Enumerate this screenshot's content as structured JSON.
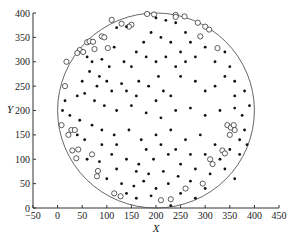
{
  "chart_data": {
    "type": "scatter",
    "title": "",
    "xlabel": "X",
    "ylabel": "Y",
    "xlim": [
      -50,
      450
    ],
    "ylim": [
      0,
      400
    ],
    "xticks": [
      -50,
      0,
      50,
      100,
      150,
      200,
      250,
      300,
      350,
      400,
      450
    ],
    "yticks": [
      0,
      50,
      100,
      150,
      200,
      250,
      300,
      350,
      400
    ],
    "grid": false,
    "legend": null,
    "boundary_circle": {
      "cx": 200,
      "cy": 200,
      "r": 200
    },
    "series": [
      {
        "name": "boundary nodes",
        "marker": "open-circle",
        "points": [
          [
            182,
            398
          ],
          [
            196,
            397
          ],
          [
            240,
            396
          ],
          [
            258,
            393
          ],
          [
            110,
            386
          ],
          [
            130,
            378
          ],
          [
            150,
            376
          ],
          [
            145,
            372
          ],
          [
            60,
            340
          ],
          [
            65,
            342
          ],
          [
            72,
            341
          ],
          [
            90,
            352
          ],
          [
            95,
            350
          ],
          [
            45,
            324
          ],
          [
            40,
            318
          ],
          [
            52,
            320
          ],
          [
            18,
            300
          ],
          [
            102,
            328
          ],
          [
            75,
            326
          ],
          [
            240,
            392
          ],
          [
            285,
            380
          ],
          [
            300,
            372
          ],
          [
            308,
            366
          ],
          [
            290,
            352
          ],
          [
            325,
            328
          ],
          [
            15,
            250
          ],
          [
            8,
            170
          ],
          [
            22,
            150
          ],
          [
            30,
            118
          ],
          [
            38,
            102
          ],
          [
            28,
            160
          ],
          [
            35,
            160
          ],
          [
            42,
            120
          ],
          [
            70,
            110
          ],
          [
            82,
            76
          ],
          [
            80,
            65
          ],
          [
            115,
            30
          ],
          [
            128,
            24
          ],
          [
            345,
            170
          ],
          [
            352,
            165
          ],
          [
            358,
            170
          ],
          [
            360,
            160
          ],
          [
            350,
            150
          ],
          [
            335,
            118
          ],
          [
            340,
            112
          ],
          [
            310,
            100
          ],
          [
            315,
            90
          ],
          [
            295,
            50
          ],
          [
            260,
            40
          ],
          [
            210,
            16
          ],
          [
            230,
            18
          ]
        ]
      },
      {
        "name": "interior nodes",
        "marker": "filled-dot",
        "points": [
          [
            120,
            370
          ],
          [
            140,
            372
          ],
          [
            200,
            390
          ],
          [
            220,
            385
          ],
          [
            190,
            360
          ],
          [
            210,
            350
          ],
          [
            175,
            340
          ],
          [
            230,
            340
          ],
          [
            90,
            305
          ],
          [
            105,
            290
          ],
          [
            135,
            300
          ],
          [
            150,
            290
          ],
          [
            60,
            310
          ],
          [
            70,
            300
          ],
          [
            85,
            270
          ],
          [
            100,
            260
          ],
          [
            130,
            255
          ],
          [
            165,
            260
          ],
          [
            185,
            250
          ],
          [
            205,
            270
          ],
          [
            250,
            270
          ],
          [
            280,
            260
          ],
          [
            300,
            240
          ],
          [
            320,
            250
          ],
          [
            340,
            270
          ],
          [
            360,
            230
          ],
          [
            40,
            230
          ],
          [
            55,
            235
          ],
          [
            75,
            220
          ],
          [
            95,
            210
          ],
          [
            120,
            200
          ],
          [
            150,
            210
          ],
          [
            180,
            195
          ],
          [
            210,
            185
          ],
          [
            240,
            200
          ],
          [
            270,
            205
          ],
          [
            300,
            190
          ],
          [
            330,
            200
          ],
          [
            360,
            205
          ],
          [
            375,
            190
          ],
          [
            25,
            190
          ],
          [
            45,
            180
          ],
          [
            70,
            170
          ],
          [
            90,
            160
          ],
          [
            115,
            150
          ],
          [
            145,
            160
          ],
          [
            170,
            140
          ],
          [
            200,
            150
          ],
          [
            230,
            160
          ],
          [
            260,
            140
          ],
          [
            290,
            150
          ],
          [
            320,
            130
          ],
          [
            350,
            120
          ],
          [
            370,
            110
          ],
          [
            60,
            100
          ],
          [
            85,
            95
          ],
          [
            110,
            110
          ],
          [
            140,
            100
          ],
          [
            165,
            90
          ],
          [
            195,
            100
          ],
          [
            225,
            110
          ],
          [
            250,
            90
          ],
          [
            280,
            80
          ],
          [
            310,
            70
          ],
          [
            340,
            80
          ],
          [
            360,
            60
          ],
          [
            100,
            60
          ],
          [
            130,
            50
          ],
          [
            155,
            45
          ],
          [
            175,
            55
          ],
          [
            200,
            40
          ],
          [
            225,
            50
          ],
          [
            250,
            30
          ],
          [
            280,
            20
          ],
          [
            300,
            40
          ],
          [
            160,
            20
          ],
          [
            190,
            25
          ],
          [
            140,
            30
          ],
          [
            230,
            5
          ],
          [
            240,
            380
          ],
          [
            260,
            360
          ],
          [
            270,
            340
          ],
          [
            250,
            320
          ],
          [
            280,
            310
          ],
          [
            300,
            330
          ],
          [
            320,
            300
          ],
          [
            340,
            320
          ],
          [
            350,
            290
          ],
          [
            360,
            260
          ],
          [
            380,
            240
          ],
          [
            380,
            160
          ],
          [
            370,
            140
          ],
          [
            385,
            130
          ],
          [
            390,
            210
          ],
          [
            10,
            200
          ],
          [
            15,
            220
          ],
          [
            50,
            260
          ],
          [
            65,
            280
          ],
          [
            115,
            330
          ],
          [
            160,
            320
          ],
          [
            180,
            310
          ],
          [
            200,
            300
          ],
          [
            220,
            310
          ],
          [
            240,
            290
          ],
          [
            260,
            300
          ],
          [
            200,
            220
          ],
          [
            215,
            240
          ],
          [
            230,
            230
          ],
          [
            160,
            230
          ],
          [
            140,
            240
          ],
          [
            110,
            240
          ],
          [
            80,
            250
          ],
          [
            120,
            130
          ],
          [
            180,
            120
          ],
          [
            210,
            130
          ],
          [
            240,
            120
          ],
          [
            270,
            110
          ],
          [
            300,
            110
          ],
          [
            330,
            100
          ],
          [
            160,
            75
          ],
          [
            185,
            70
          ],
          [
            215,
            75
          ],
          [
            245,
            65
          ],
          [
            270,
            55
          ],
          [
            120,
            80
          ],
          [
            90,
            130
          ],
          [
            55,
            140
          ],
          [
            40,
            150
          ]
        ]
      }
    ]
  }
}
